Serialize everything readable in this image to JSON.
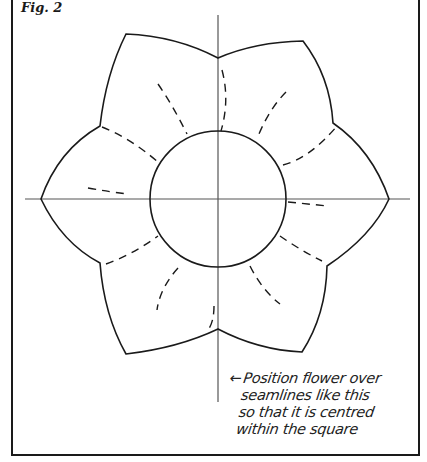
{
  "figure": {
    "label": "Fig. 2",
    "annotation": {
      "arrow": "←",
      "lines": [
        "Position flower over",
        "seamlines like this",
        "so that it is centred",
        "within the square"
      ]
    },
    "diagram": {
      "description": "Six-petal flower template centred over crossing seamlines, with dashed stitch lines on each petal and a central circle",
      "center": [
        218,
        199
      ],
      "circle_radius": 68,
      "petal_count": 6,
      "colors": {
        "line": "#1a1a1a",
        "seamline": "#555555",
        "background": "#ffffff"
      }
    }
  }
}
